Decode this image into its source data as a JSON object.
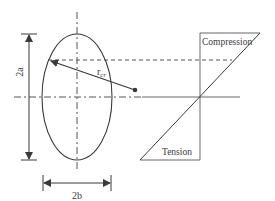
{
  "diagram": {
    "labels": {
      "height_dimension": "2a",
      "width_dimension": "2b",
      "radius_main": "r",
      "radius_sub": "cr",
      "compression": "Compression",
      "tension": "Tension"
    },
    "colors": {
      "line": "#3a3a3a",
      "stress_line": "#555555",
      "background": "#ffffff"
    }
  }
}
